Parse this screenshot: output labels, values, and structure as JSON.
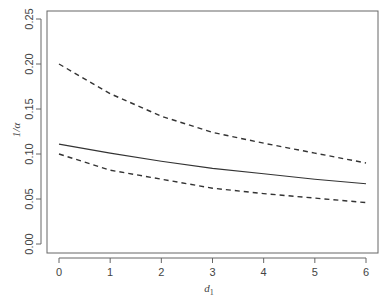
{
  "chart_data": {
    "type": "line",
    "title": "",
    "xlabel": "d1",
    "xlabel_main": "d",
    "xlabel_sub": "1",
    "ylabel": "1/α",
    "xlim": [
      0,
      6
    ],
    "ylim": [
      0,
      0.25
    ],
    "x_ticks": [
      "0",
      "1",
      "2",
      "3",
      "4",
      "5",
      "6"
    ],
    "y_ticks": [
      "0.00",
      "0.05",
      "0.10",
      "0.15",
      "0.20",
      "0.25"
    ],
    "grid": false,
    "legend": null,
    "x": [
      0,
      1,
      2,
      3,
      4,
      5,
      6
    ],
    "series": [
      {
        "name": "estimate",
        "style": "solid",
        "values": [
          0.111,
          0.101,
          0.092,
          0.084,
          0.078,
          0.072,
          0.067
        ]
      },
      {
        "name": "upper bound",
        "style": "dashed",
        "values": [
          0.2,
          0.167,
          0.142,
          0.124,
          0.112,
          0.101,
          0.09
        ]
      },
      {
        "name": "lower bound",
        "style": "dashed",
        "values": [
          0.1,
          0.082,
          0.072,
          0.062,
          0.056,
          0.051,
          0.046
        ]
      }
    ],
    "colors": {
      "line": "#333333",
      "axis": "#555555",
      "text": "#444444"
    }
  }
}
